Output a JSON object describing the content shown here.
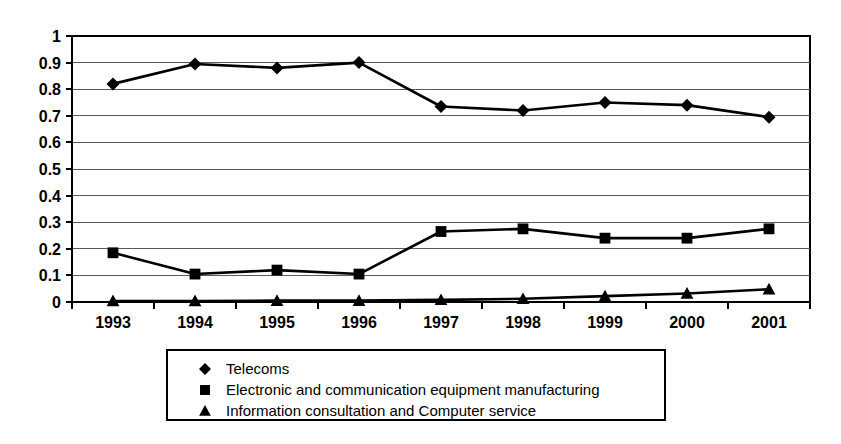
{
  "chart_data": {
    "type": "line",
    "title": "",
    "xlabel": "",
    "ylabel": "",
    "categories": [
      "1993",
      "1994",
      "1995",
      "1996",
      "1997",
      "1998",
      "1999",
      "2000",
      "2001"
    ],
    "ylim": [
      0,
      1
    ],
    "y_ticks": [
      "0",
      "0.1",
      "0.2",
      "0.3",
      "0.4",
      "0.5",
      "0.6",
      "0.7",
      "0.8",
      "0.9",
      "1"
    ],
    "y_tick_values": [
      0,
      0.1,
      0.2,
      0.3,
      0.4,
      0.5,
      0.6,
      0.7,
      0.8,
      0.9,
      1
    ],
    "grid": "horizontal",
    "legend_position": "bottom",
    "series": [
      {
        "name": "Telecoms",
        "marker": "diamond",
        "color": "#000000",
        "values": [
          0.82,
          0.895,
          0.88,
          0.9,
          0.735,
          0.72,
          0.75,
          0.74,
          0.695
        ]
      },
      {
        "name": "Electronic and communication equipment manufacturing",
        "marker": "square",
        "color": "#000000",
        "values": [
          0.185,
          0.105,
          0.12,
          0.105,
          0.265,
          0.275,
          0.24,
          0.24,
          0.275
        ]
      },
      {
        "name": "Information consultation and Computer service",
        "marker": "triangle",
        "color": "#000000",
        "values": [
          0.004,
          0.004,
          0.005,
          0.005,
          0.008,
          0.012,
          0.022,
          0.032,
          0.048
        ]
      }
    ]
  },
  "legend": {
    "entries": [
      {
        "label": "Telecoms",
        "marker": "diamond"
      },
      {
        "label": "Electronic and communication equipment manufacturing",
        "marker": "square"
      },
      {
        "label": "Information consultation and Computer service",
        "marker": "triangle"
      }
    ]
  }
}
